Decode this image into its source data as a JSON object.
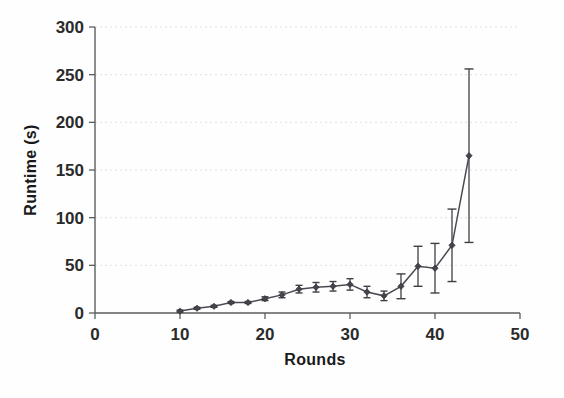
{
  "chart_data": {
    "type": "line",
    "title": "",
    "subtitle": "",
    "xlabel": "Rounds",
    "ylabel": "Runtime (s)",
    "xlim": [
      0,
      50
    ],
    "ylim": [
      0,
      300
    ],
    "xticks": [
      0,
      10,
      20,
      30,
      40,
      50
    ],
    "yticks": [
      0,
      50,
      100,
      150,
      200,
      250,
      300
    ],
    "grid": "horizontal-dotted",
    "legend": "none",
    "error_bars": "symmetric-vertical",
    "marker": "diamond",
    "x": [
      10,
      12,
      14,
      16,
      18,
      20,
      22,
      24,
      26,
      28,
      30,
      32,
      34,
      36,
      38,
      40,
      42,
      44
    ],
    "series": [
      {
        "name": "Runtime",
        "values": [
          2,
          5,
          7,
          11,
          11,
          15,
          19,
          25,
          27,
          28,
          30,
          22,
          18,
          28,
          49,
          47,
          71,
          165
        ],
        "errors": [
          1,
          1,
          1,
          1,
          1,
          2,
          3,
          4,
          5,
          5,
          6,
          6,
          5,
          13,
          21,
          26,
          38,
          91
        ]
      }
    ]
  },
  "axis": {
    "x_tick_labels": [
      "0",
      "10",
      "20",
      "30",
      "40",
      "50"
    ],
    "y_tick_labels": [
      "0",
      "50",
      "100",
      "150",
      "200",
      "250",
      "300"
    ],
    "x_title": "Rounds",
    "y_title": "Runtime (s)"
  }
}
